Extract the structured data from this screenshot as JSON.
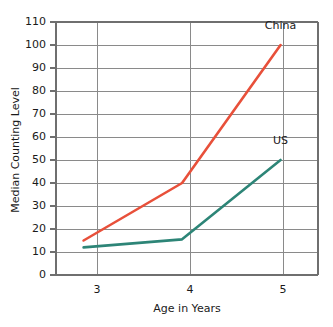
{
  "chart_data": {
    "type": "line",
    "title": "",
    "xlabel": "Age in Years",
    "ylabel": "Median Counting Level",
    "x": [
      3,
      4,
      5
    ],
    "categories": [
      "3",
      "4",
      "5"
    ],
    "xtick_labels": [
      "3",
      "4",
      "5"
    ],
    "ytick_labels": [
      "0",
      "10",
      "20",
      "30",
      "40",
      "50",
      "60",
      "70",
      "80",
      "90",
      "100",
      "110"
    ],
    "ytick_values": [
      0,
      10,
      20,
      30,
      40,
      50,
      60,
      70,
      80,
      90,
      100,
      110
    ],
    "ylim": [
      0,
      110
    ],
    "xlim": [
      2.72,
      5.38
    ],
    "grid": true,
    "legend_position": "inline-at-line-end",
    "series": [
      {
        "name": "China",
        "label": "China",
        "color": "#e8503a",
        "values": [
          15,
          40,
          100
        ],
        "label_point": {
          "x": 5,
          "y": 107
        }
      },
      {
        "name": "US",
        "label": "US",
        "color": "#2d8577",
        "values": [
          12,
          15.5,
          50
        ],
        "label_point": {
          "x": 5,
          "y": 57
        }
      }
    ]
  },
  "axes": {
    "y_title": "Median Counting Level",
    "x_title": "Age in Years"
  }
}
